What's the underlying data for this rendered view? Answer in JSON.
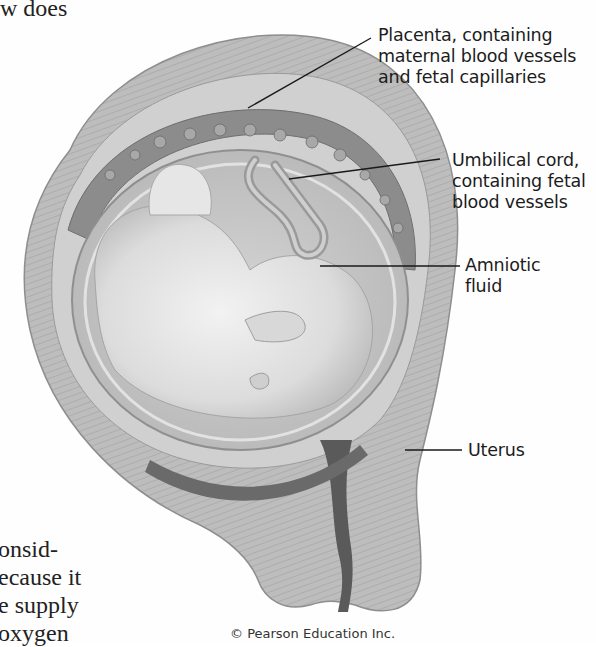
{
  "body_text": {
    "top_fragment": "w does",
    "bottom_lines": [
      "onsid-",
      "ecause it",
      "e supply",
      "oxygen"
    ]
  },
  "figure": {
    "labels": [
      {
        "id": "placenta",
        "lines": [
          "Placenta, containing",
          "maternal blood vessels",
          "and fetal capillaries"
        ]
      },
      {
        "id": "umbilical-cord",
        "lines": [
          "Umbilical cord,",
          "containing fetal",
          "blood vessels"
        ]
      },
      {
        "id": "amniotic-fluid",
        "lines": [
          "Amniotic",
          "fluid"
        ]
      },
      {
        "id": "uterus",
        "lines": [
          "Uterus"
        ]
      }
    ],
    "credit": "© Pearson Education Inc.",
    "colors": {
      "uterus_wall": "#b9b9b9",
      "uterus_stripe": "#a6a6a6",
      "placenta": "#8a8a8a",
      "amniotic": "#c9c9c9",
      "fetus": "#e4e4e4",
      "cervix_dark": "#5a5a5a",
      "leader_line": "#1a1a1a"
    }
  }
}
